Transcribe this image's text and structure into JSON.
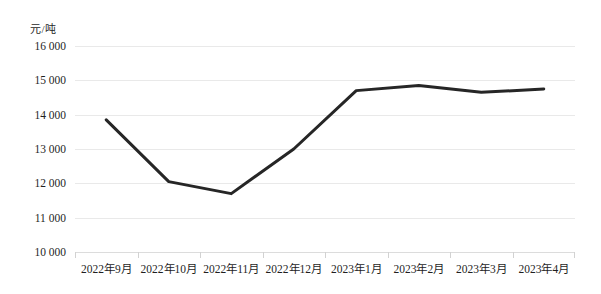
{
  "chart_data": {
    "type": "line",
    "title": "",
    "subtitle": "",
    "xlabel": "",
    "ylabel": "元/吨",
    "unit_caption": "元/吨",
    "categories": [
      "2022年9月",
      "2022年10月",
      "2022年11月",
      "2022年12月",
      "2023年1月",
      "2023年2月",
      "2023年3月",
      "2023年4月"
    ],
    "series": [
      {
        "name": "价格",
        "color": "#262626",
        "values": [
          13850,
          12050,
          11700,
          13000,
          14700,
          14850,
          14650,
          14750
        ]
      }
    ],
    "ylim": [
      10000,
      16000
    ],
    "yticks": [
      10000,
      11000,
      12000,
      13000,
      14000,
      15000,
      16000
    ],
    "ytick_labels": [
      "10 000",
      "11 000",
      "12 000",
      "13 000",
      "14 000",
      "15 000",
      "16 000"
    ],
    "grid": true,
    "grid_color": "#e9e9e9",
    "legend": "none",
    "background": "#ffffff"
  }
}
